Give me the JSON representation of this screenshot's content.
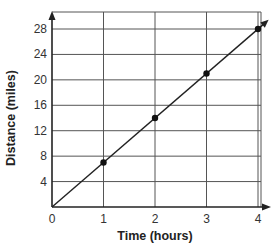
{
  "chart_data": {
    "type": "line",
    "title": "",
    "xlabel": "Time (hours)",
    "ylabel": "Distance (miles)",
    "x": [
      1,
      2,
      3,
      4
    ],
    "series": [
      {
        "name": "Distance",
        "values": [
          7,
          14,
          21,
          28
        ],
        "markers": true,
        "line_from_origin": true,
        "arrow_end": true
      }
    ],
    "xlim": [
      0,
      4
    ],
    "ylim": [
      0,
      28
    ],
    "x_ticks": [
      "0",
      "1",
      "2",
      "3",
      "4"
    ],
    "y_ticks": [
      "4",
      "8",
      "12",
      "16",
      "20",
      "24",
      "28"
    ],
    "grid": true,
    "legend": null
  },
  "colors": {
    "grid": "#555555",
    "line": "#222222",
    "marker": "#111111",
    "axis": "#222222"
  }
}
